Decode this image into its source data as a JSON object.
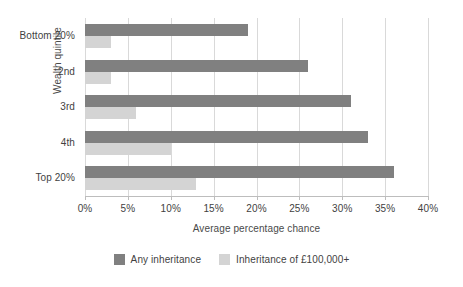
{
  "chart_data": {
    "type": "bar",
    "orientation": "horizontal",
    "title": "",
    "xlabel": "Average percentage chance",
    "ylabel": "Wealth quintile",
    "categories": [
      "Bottom 20%",
      "2nd",
      "3rd",
      "4th",
      "Top 20%"
    ],
    "series": [
      {
        "name": "Any inheritance",
        "color": "#808080",
        "values": [
          19,
          26,
          31,
          33,
          36
        ]
      },
      {
        "name": "Inheritance of £100,000+",
        "color": "#d4d4d4",
        "values": [
          3,
          3,
          6,
          10,
          13
        ]
      }
    ],
    "xlim": [
      0,
      40
    ],
    "xticks": [
      0,
      5,
      10,
      15,
      20,
      25,
      30,
      35,
      40
    ],
    "xtick_labels": [
      "0%",
      "5%",
      "10%",
      "15%",
      "20%",
      "25%",
      "30%",
      "35%",
      "40%"
    ],
    "grid": "vertical",
    "legend_position": "bottom",
    "value_suffix": "%"
  },
  "legend": {
    "items": [
      {
        "label": "Any inheritance",
        "color": "#808080"
      },
      {
        "label": "Inheritance of £100,000+",
        "color": "#d4d4d4"
      }
    ]
  },
  "colors": {
    "series_dark": "#808080",
    "series_light": "#d4d4d4",
    "gridline": "#d9d9d9",
    "axis": "#bdbdbd",
    "text": "#3f3f3f",
    "background": "#ffffff"
  }
}
